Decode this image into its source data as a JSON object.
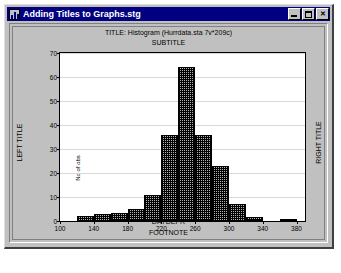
{
  "window": {
    "title": "Adding Titles to Graphs.stg",
    "icon": "graph-document-icon",
    "buttons": {
      "minimize": "minimize-icon",
      "maximize": "maximize-icon",
      "close": "✕"
    }
  },
  "graph": {
    "title": "TITLE: Histogram (Hurrdata.sta 7v*209c)",
    "subtitle": "SUBTITLE",
    "left_title": "LEFT TITLE",
    "right_title": "RIGHT TITLE",
    "footnote": "FOOTNOTE",
    "colors": {
      "bar_fill": "#b4b4b4",
      "bar_edge": "#000000",
      "grid": "#d9d9d9",
      "plot_bg": "#ffffff",
      "window_bg": "#c0c0c0",
      "titlebar_bg": "#000080",
      "titlebar_fg": "#ffffff"
    }
  },
  "chart_data": {
    "type": "bar",
    "title": "TITLE: Histogram (Hurrdata.sta 7v*209c)",
    "subtitle": "SUBTITLE",
    "xlabel": "DAYDEPR",
    "ylabel": "No of obs",
    "xlim": [
      100,
      390
    ],
    "ylim": [
      0,
      70
    ],
    "xticks": [
      100,
      140,
      180,
      220,
      260,
      300,
      340,
      380
    ],
    "yticks": [
      0,
      10,
      20,
      30,
      40,
      50,
      60,
      70
    ],
    "grid": true,
    "legend": false,
    "bin_width": 20,
    "bins": [
      {
        "start": 120,
        "end": 140,
        "value": 2
      },
      {
        "start": 140,
        "end": 160,
        "value": 3
      },
      {
        "start": 160,
        "end": 180,
        "value": 3.5
      },
      {
        "start": 180,
        "end": 200,
        "value": 5
      },
      {
        "start": 200,
        "end": 220,
        "value": 11
      },
      {
        "start": 220,
        "end": 240,
        "value": 36
      },
      {
        "start": 240,
        "end": 260,
        "value": 64
      },
      {
        "start": 260,
        "end": 280,
        "value": 36
      },
      {
        "start": 280,
        "end": 300,
        "value": 23
      },
      {
        "start": 300,
        "end": 320,
        "value": 7
      },
      {
        "start": 320,
        "end": 340,
        "value": 1.5
      },
      {
        "start": 360,
        "end": 380,
        "value": 0.8
      }
    ],
    "categories": [
      "120-140",
      "140-160",
      "160-180",
      "180-200",
      "200-220",
      "220-240",
      "240-260",
      "260-280",
      "280-300",
      "300-320",
      "320-340",
      "360-380"
    ],
    "values": [
      2,
      3,
      3.5,
      5,
      11,
      36,
      64,
      36,
      23,
      7,
      1.5,
      0.8
    ]
  }
}
